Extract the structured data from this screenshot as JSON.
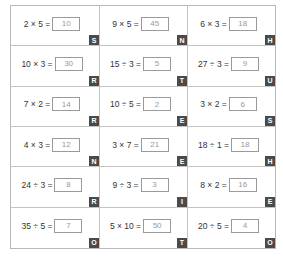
{
  "worksheet": {
    "colors": {
      "grid_border": "#c4c4c4",
      "answer_border": "#9a9a9a",
      "answer_text": "#9a9a9a",
      "badge_bg": "#4a4a4a",
      "badge_text": "#ffffff"
    },
    "rows": [
      [
        {
          "expr": "2 × 5 =",
          "answer": "10",
          "letter": "S"
        },
        {
          "expr": "9 × 5 =",
          "answer": "45",
          "letter": "N"
        },
        {
          "expr": "6 × 3 =",
          "answer": "18",
          "letter": "H"
        }
      ],
      [
        {
          "expr": "10 × 3 =",
          "answer": "30",
          "letter": "R"
        },
        {
          "expr": "15 ÷ 3 =",
          "answer": "5",
          "letter": "T"
        },
        {
          "expr": "27 ÷ 3 =",
          "answer": "9",
          "letter": "U"
        }
      ],
      [
        {
          "expr": "7 × 2 =",
          "answer": "14",
          "letter": "R"
        },
        {
          "expr": "10 ÷ 5 =",
          "answer": "2",
          "letter": "E"
        },
        {
          "expr": "3 × 2 =",
          "answer": "6",
          "letter": "S"
        }
      ],
      [
        {
          "expr": "4 × 3 =",
          "answer": "12",
          "letter": "N"
        },
        {
          "expr": "3 × 7 =",
          "answer": "21",
          "letter": "E"
        },
        {
          "expr": "18 ÷ 1 =",
          "answer": "18",
          "letter": "H"
        }
      ],
      [
        {
          "expr": "24 ÷ 3 =",
          "answer": "8",
          "letter": "R"
        },
        {
          "expr": "9 ÷ 3 =",
          "answer": "3",
          "letter": "I"
        },
        {
          "expr": "8 × 2 =",
          "answer": "16",
          "letter": "E"
        }
      ],
      [
        {
          "expr": "35 ÷ 5 =",
          "answer": "7",
          "letter": "O"
        },
        {
          "expr": "5 × 10 =",
          "answer": "50",
          "letter": "T"
        },
        {
          "expr": "20 ÷ 5 =",
          "answer": "4",
          "letter": "O"
        }
      ]
    ]
  }
}
